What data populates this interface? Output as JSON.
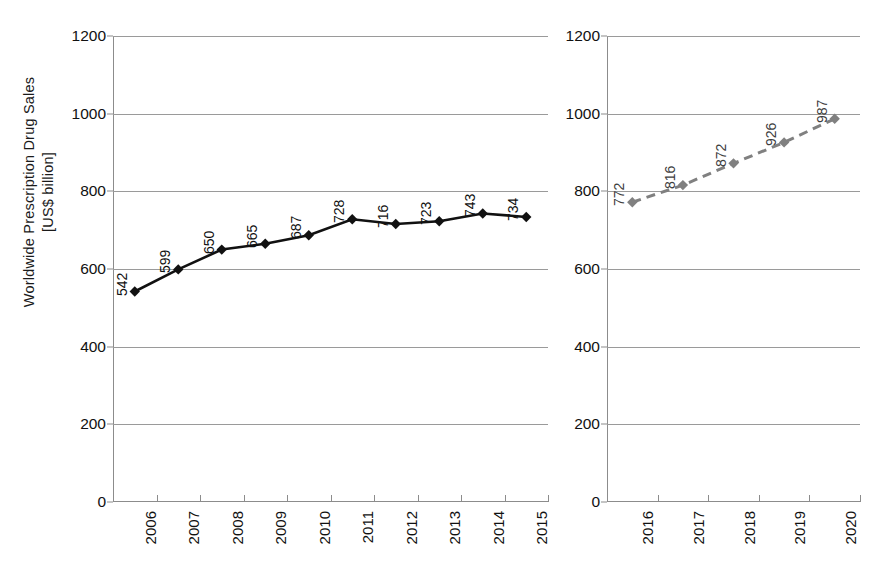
{
  "chart_data": [
    {
      "type": "line",
      "panel": "historical",
      "title": "",
      "xlabel": "",
      "ylabel": "Worldwide Prescription Drug Sales [US$ billion]",
      "categories": [
        "2006",
        "2007",
        "2008",
        "2009",
        "2010",
        "2011",
        "2012",
        "2013",
        "2014",
        "2015"
      ],
      "values": [
        542,
        599,
        650,
        665,
        687,
        728,
        716,
        723,
        743,
        734
      ],
      "point_labels": [
        "542",
        "599",
        "650",
        "665",
        "687",
        "728",
        "716",
        "723",
        "743",
        "734"
      ],
      "ylim": [
        0,
        1200
      ],
      "yticks": [
        0,
        200,
        400,
        600,
        800,
        1000,
        1200
      ],
      "ytick_labels": [
        "0",
        "200",
        "400",
        "600",
        "800",
        "1000",
        "1200"
      ],
      "grid": true,
      "legend": "none",
      "line_style": "solid",
      "marker": "diamond",
      "color": "#111111"
    },
    {
      "type": "line",
      "panel": "forecast",
      "title": "",
      "xlabel": "",
      "ylabel": "",
      "categories": [
        "2016",
        "2017",
        "2018",
        "2019",
        "2020"
      ],
      "values": [
        772,
        816,
        872,
        926,
        987
      ],
      "point_labels": [
        "772",
        "816",
        "872",
        "926",
        "987"
      ],
      "ylim": [
        0,
        1200
      ],
      "yticks": [
        0,
        200,
        400,
        600,
        800,
        1000,
        1200
      ],
      "ytick_labels": [
        "0",
        "200",
        "400",
        "600",
        "800",
        "1000",
        "1200"
      ],
      "grid": true,
      "legend": "none",
      "line_style": "dashed",
      "marker": "diamond",
      "color": "#808080"
    }
  ],
  "axis": {
    "y_title": "Worldwide Prescription Drug Sales\n[US$ billion]"
  },
  "colors": {
    "historical_series": "#111111",
    "forecast_series": "#808080",
    "gridline": "#9a9a9a",
    "axis": "#8c8c8c",
    "background": "#ffffff"
  }
}
